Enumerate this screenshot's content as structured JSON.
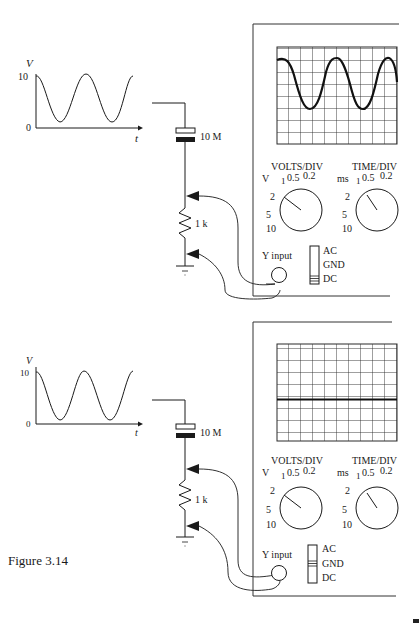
{
  "figure": {
    "caption": "Figure 3.14"
  },
  "panels": [
    {
      "id": "top",
      "source_plot": {
        "y_axis_label": "V",
        "x_axis_label": "t",
        "y_ticks": [
          "10",
          "0"
        ]
      },
      "circuit": {
        "capacitor_label": "10 M",
        "resistor_label": "1 k"
      },
      "scope": {
        "volts_div_title": "VOLTS/DIV",
        "time_div_title": "TIME/DIV",
        "volts_unit": "V",
        "time_unit": "ms",
        "volts_ticks": [
          "1",
          "0.5",
          "0.2",
          "2",
          "5",
          "10"
        ],
        "time_ticks": [
          "1",
          "0.5",
          "0.2",
          "2",
          "5",
          "10"
        ],
        "y_input_label": "Y input",
        "coupling_options": [
          "AC",
          "GND",
          "DC"
        ],
        "coupling_selected": "DC",
        "trace": "sine"
      }
    },
    {
      "id": "bottom",
      "source_plot": {
        "y_axis_label": "V",
        "x_axis_label": "t",
        "y_ticks": [
          "10",
          "0"
        ]
      },
      "circuit": {
        "capacitor_label": "10 M",
        "resistor_label": "1 k"
      },
      "scope": {
        "volts_div_title": "VOLTS/DIV",
        "time_div_title": "TIME/DIV",
        "volts_unit": "V",
        "time_unit": "ms",
        "volts_ticks": [
          "1",
          "0.5",
          "0.2",
          "2",
          "5",
          "10"
        ],
        "time_ticks": [
          "1",
          "0.5",
          "0.2",
          "2",
          "5",
          "10"
        ],
        "y_input_label": "Y input",
        "coupling_options": [
          "AC",
          "GND",
          "DC"
        ],
        "coupling_selected": "GND",
        "trace": "flat"
      }
    }
  ]
}
